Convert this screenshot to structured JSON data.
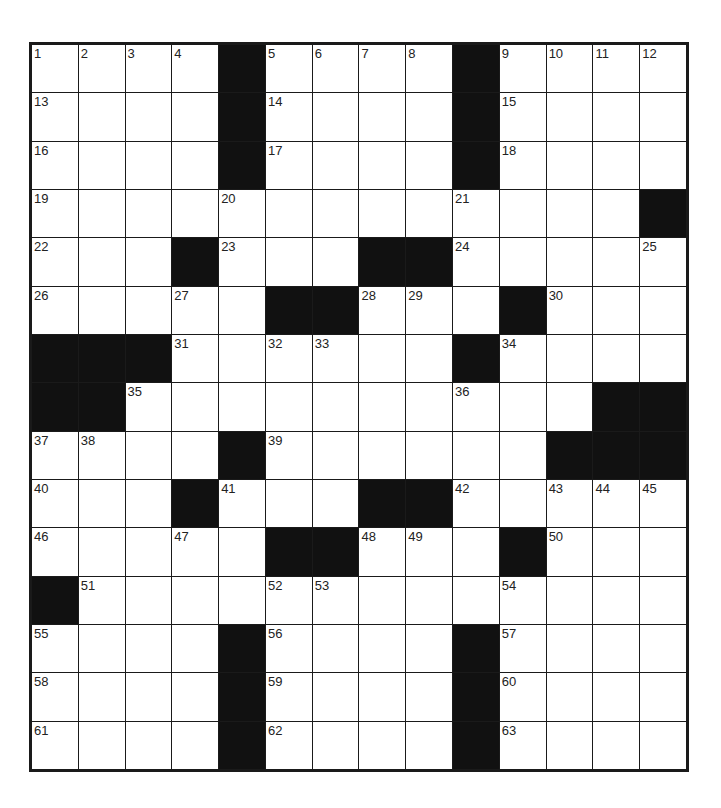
{
  "puzzle": {
    "rows": 15,
    "cols": 14,
    "colors": {
      "block": "#111111",
      "cell": "#ffffff",
      "border": "#1a1a1a",
      "number": "#222222"
    },
    "grid": [
      [
        "1",
        "2",
        "3",
        "4",
        "#",
        "5",
        "6",
        "7",
        "8",
        "#",
        "9",
        "10",
        "11",
        "12"
      ],
      [
        "13",
        "",
        "",
        "",
        "#",
        "14",
        "",
        "",
        "",
        "#",
        "15",
        "",
        "",
        ""
      ],
      [
        "16",
        "",
        "",
        "",
        "#",
        "17",
        "",
        "",
        "",
        "#",
        "18",
        "",
        "",
        ""
      ],
      [
        "19",
        "",
        "",
        "",
        "20",
        "",
        "",
        "",
        "",
        "21",
        "",
        "",
        "",
        "#"
      ],
      [
        "22",
        "",
        "",
        "#",
        "23",
        "",
        "",
        "#",
        "#",
        "24",
        "",
        "",
        "",
        "25"
      ],
      [
        "26",
        "",
        "",
        "27",
        "",
        "#",
        "#",
        "28",
        "29",
        "",
        "#",
        "30",
        "",
        ""
      ],
      [
        "#",
        "#",
        "#",
        "31",
        "",
        "32",
        "33",
        "",
        "",
        "#",
        "34",
        "",
        "",
        ""
      ],
      [
        "#",
        "#",
        "35",
        "",
        "",
        "",
        "",
        "",
        "",
        "36",
        "",
        "",
        "#",
        "#"
      ],
      [
        "37",
        "38",
        "",
        "",
        "#",
        "39",
        "",
        "",
        "",
        "",
        "",
        "#",
        "#",
        "#"
      ],
      [
        "40",
        "",
        "",
        "#",
        "41",
        "",
        "",
        "#",
        "#",
        "42",
        "",
        "43",
        "44",
        "45"
      ],
      [
        "46",
        "",
        "",
        "47",
        "",
        "#",
        "#",
        "48",
        "49",
        "",
        "#",
        "50",
        "",
        ""
      ],
      [
        "#",
        "51",
        "",
        "",
        "",
        "52",
        "53",
        "",
        "",
        "",
        "54",
        "",
        "",
        ""
      ],
      [
        "55",
        "",
        "",
        "",
        "#",
        "56",
        "",
        "",
        "",
        "#",
        "57",
        "",
        "",
        ""
      ],
      [
        "58",
        "",
        "",
        "",
        "#",
        "59",
        "",
        "",
        "",
        "#",
        "60",
        "",
        "",
        ""
      ],
      [
        "61",
        "",
        "",
        "",
        "#",
        "62",
        "",
        "",
        "",
        "#",
        "63",
        "",
        "",
        ""
      ]
    ]
  }
}
